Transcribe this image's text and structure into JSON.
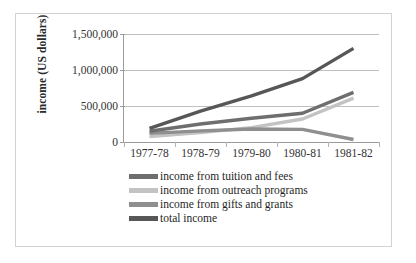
{
  "chart_data": {
    "type": "line",
    "title": "",
    "xlabel": "",
    "ylabel": "income (US dollars)",
    "categories": [
      "1977-78",
      "1978-79",
      "1979-80",
      "1980-81",
      "1981-82"
    ],
    "ylim": [
      0,
      1500000
    ],
    "yticks": [
      0,
      500000,
      1000000,
      1500000
    ],
    "ytick_labels": [
      "0",
      "500,000",
      "1,000,000",
      "1,500,000"
    ],
    "grid": true,
    "legend_position": "bottom-left",
    "series": [
      {
        "name": "income from tuition and fees",
        "color": "#6e6e6e",
        "values": [
          150000,
          250000,
          330000,
          400000,
          690000
        ]
      },
      {
        "name": "income from outreach programs",
        "color": "#c3c3c3",
        "values": [
          75000,
          130000,
          200000,
          320000,
          610000
        ]
      },
      {
        "name": "income from gifts and grants",
        "color": "#8f8f8f",
        "values": [
          120000,
          155000,
          180000,
          175000,
          35000
        ]
      },
      {
        "name": "total income",
        "color": "#575757",
        "values": [
          190000,
          430000,
          640000,
          880000,
          1300000
        ]
      }
    ]
  },
  "colors": {
    "grid": "#bfbfbf",
    "axis": "#9a9a9a",
    "border": "#d2d2d2",
    "text": "#333333"
  }
}
